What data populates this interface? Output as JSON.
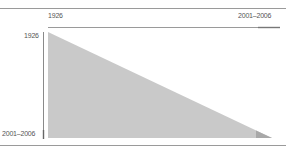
{
  "diagram": {
    "type": "triangle-matrix",
    "x_axis": {
      "start_label": "1926",
      "end_label": "2001–2006"
    },
    "y_axis": {
      "start_label": "1926",
      "end_label": "2001–2006"
    },
    "colors": {
      "triangle_fill": "#c9c9c9",
      "corner_fill": "#a8a8a8",
      "rule": "#9a9a9a",
      "axis": "#7a7a7a",
      "highlight_segment": "#888888",
      "label_text": "#555555"
    }
  }
}
